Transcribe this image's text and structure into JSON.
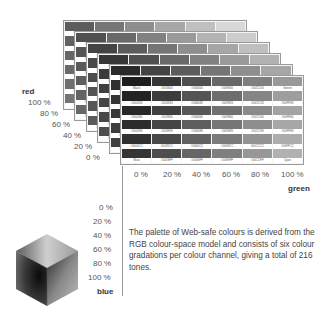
{
  "red_axis": {
    "title": "red",
    "ticks": [
      "100 %",
      "80 %",
      "60 %",
      "40 %",
      "20 %",
      "0 %"
    ]
  },
  "green_axis": {
    "title": "green",
    "ticks": [
      "0 %",
      "20 %",
      "40 %",
      "60 %",
      "80 %",
      "100 %"
    ]
  },
  "blue_axis": {
    "title": "blue",
    "ticks": [
      "0 %",
      "20 %",
      "40 %",
      "60 %",
      "80 %",
      "100 %"
    ]
  },
  "front_layer": {
    "rows": [
      [
        "Black",
        "#003300",
        "#006600",
        "#009900",
        "#00CC00",
        "Green"
      ],
      [
        "#000033",
        "#003333",
        "#006633",
        "#009933",
        "#00CC33",
        "#00FF33"
      ],
      [
        "#000066",
        "#003366",
        "#006666",
        "#009966",
        "#00CC66",
        "#00FF66"
      ],
      [
        "#000099",
        "#003399",
        "#006699",
        "#009999",
        "#00CC99",
        "#00FF99"
      ],
      [
        "#0000CC",
        "#0033CC",
        "#0066CC",
        "#0099CC",
        "#00CCCC",
        "#00FFCC"
      ],
      [
        "Blue",
        "#0033FF",
        "#0066FF",
        "#0099FF",
        "#00CCFF",
        "Cyan"
      ]
    ]
  },
  "description": "The palette of Web-safe colours is derived from the RGB colour-space model and consists of six colour gradations per colour channel, giving a total of 216 tones."
}
